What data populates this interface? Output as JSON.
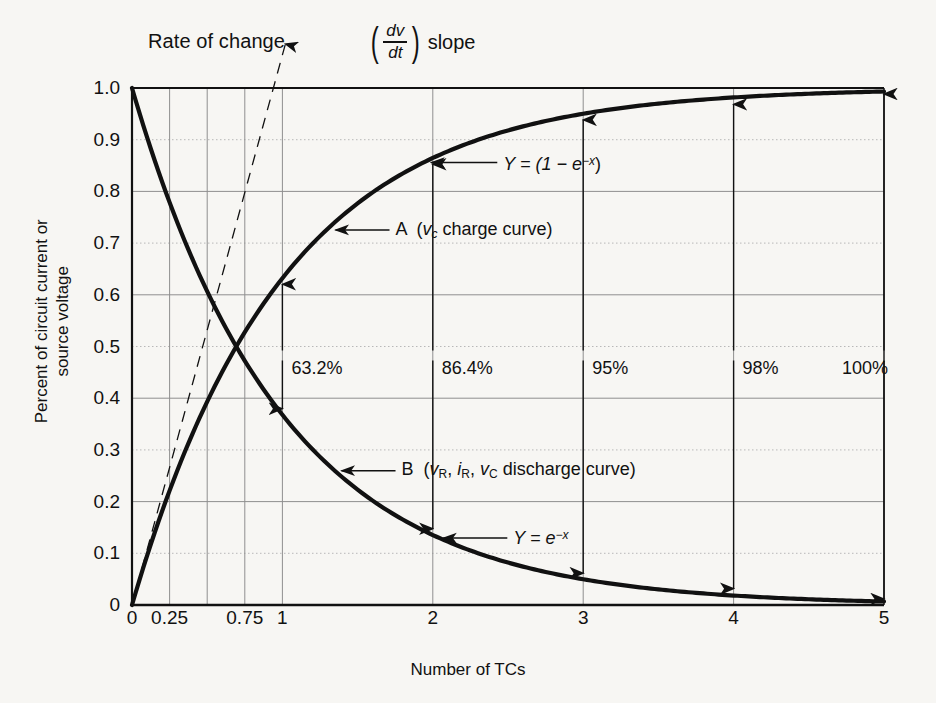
{
  "header": {
    "rate_of_change": "Rate of change",
    "slope_numerator": "dv",
    "slope_denominator": "dt",
    "slope_word": "slope",
    "paren_open": "(",
    "paren_close": ")"
  },
  "axes": {
    "ylabel_line1": "Percent of circuit current or",
    "ylabel_line2": "source voltage",
    "xlabel": "Number of TCs"
  },
  "chart_data": {
    "type": "line",
    "title": "",
    "xlabel": "Number of TCs",
    "ylabel": "Percent of circuit current or source voltage",
    "xlim": [
      0,
      5
    ],
    "ylim": [
      0,
      1.0
    ],
    "grid": true,
    "legend_position": "inline-annotations",
    "y_ticks": [
      "0",
      "0.1",
      "0.2",
      "0.3",
      "0.4",
      "0.5",
      "0.6",
      "0.7",
      "0.8",
      "0.9",
      "1.0"
    ],
    "y_tick_values": [
      0,
      0.1,
      0.2,
      0.3,
      0.4,
      0.5,
      0.6,
      0.7,
      0.8,
      0.9,
      1.0
    ],
    "x_ticks": [
      "0",
      "0.25",
      "0.75",
      "1",
      "2",
      "3",
      "4",
      "5"
    ],
    "x_tick_values": [
      0,
      0.25,
      0.75,
      1,
      2,
      3,
      4,
      5
    ],
    "x_gridline_values": [
      0.25,
      0.5,
      0.75,
      1,
      2,
      3,
      4,
      5
    ],
    "percent_markers": [
      {
        "label": "63.2%",
        "x": 1,
        "y": 0.632
      },
      {
        "label": "86.4%",
        "x": 2,
        "y": 0.864
      },
      {
        "label": "95%",
        "x": 3,
        "y": 0.95
      },
      {
        "label": "98%",
        "x": 4,
        "y": 0.98
      },
      {
        "label": "100%",
        "x": 5,
        "y": 1.0
      }
    ],
    "series": [
      {
        "name": "A",
        "equation": "Y = (1 - e^-x)",
        "description": "vc charge curve",
        "style": "solid",
        "x": [
          0,
          0.25,
          0.5,
          0.75,
          1,
          1.25,
          1.5,
          1.75,
          2,
          2.5,
          3,
          3.5,
          4,
          4.5,
          5
        ],
        "values": [
          0,
          0.221,
          0.393,
          0.528,
          0.632,
          0.713,
          0.777,
          0.826,
          0.865,
          0.918,
          0.95,
          0.97,
          0.982,
          0.989,
          0.993
        ]
      },
      {
        "name": "B",
        "equation": "Y = e^-x",
        "description": "vR, iR, vC discharge curve",
        "style": "solid",
        "x": [
          0,
          0.25,
          0.5,
          0.75,
          1,
          1.25,
          1.5,
          1.75,
          2,
          2.5,
          3,
          3.5,
          4,
          4.5,
          5
        ],
        "values": [
          1.0,
          0.779,
          0.607,
          0.472,
          0.368,
          0.287,
          0.223,
          0.174,
          0.135,
          0.082,
          0.05,
          0.03,
          0.018,
          0.011,
          0.007
        ]
      },
      {
        "name": "dv/dt slope",
        "equation": "initial rate of change tangent",
        "description": "dashed tangent through origin with slope 1 per TC",
        "style": "dashed",
        "x": [
          0,
          1
        ],
        "values": [
          0,
          1.0
        ]
      }
    ]
  },
  "annotations": {
    "charge_curve_label": "A",
    "charge_curve_paren_open": "(",
    "charge_curve_v": "v",
    "charge_curve_sub": "c",
    "charge_curve_rest": "charge curve)",
    "charge_eq_prefix": "Y = (1 − e",
    "charge_eq_sup": "−x",
    "charge_eq_suffix": ")",
    "discharge_curve_label": "B",
    "discharge_paren_open": "(",
    "discharge_v1": "v",
    "discharge_sub1": "R",
    "discharge_sep1": ",",
    "discharge_i": "i",
    "discharge_sub2": "R",
    "discharge_sep2": ",",
    "discharge_v2": "v",
    "discharge_sub3": "C",
    "discharge_rest": "discharge curve)",
    "discharge_eq_prefix": "Y = e",
    "discharge_eq_sup": "−x"
  },
  "colors": {
    "ink": "#111111",
    "grid_solid": "#8f8f8f",
    "grid_dotted": "#b8b8b8",
    "background": "#f7f6f3"
  }
}
